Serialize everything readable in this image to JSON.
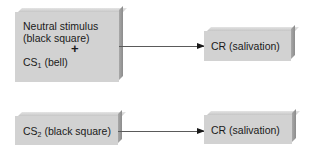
{
  "diagram": {
    "row1": {
      "stimulus_box": {
        "line1": "Neutral stimulus",
        "line2": "(black square)",
        "plus": "+",
        "cs_prefix": "CS",
        "cs_sub": "1",
        "cs_suffix": " (bell)"
      },
      "response_box": {
        "label": "CR (salivation)"
      }
    },
    "row2": {
      "stimulus_box": {
        "cs_prefix": "CS",
        "cs_sub": "2",
        "cs_suffix": " (black square)"
      },
      "response_box": {
        "label": "CR (salivation)"
      }
    },
    "colors": {
      "box_fill": "#d2d2d2",
      "box_shadow": "#8c8c8c",
      "arrow": "#1a1a1a"
    }
  }
}
